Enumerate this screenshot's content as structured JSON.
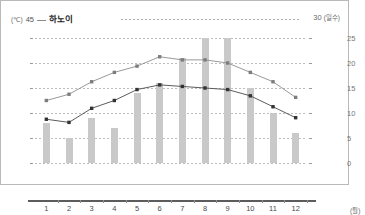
{
  "header": {
    "left_unit": "(℃)",
    "left_axis_max": "45",
    "city": "하노이",
    "right_axis_max": "30",
    "right_unit": "(일수)"
  },
  "axes": {
    "left_ticks": [
      "40",
      "32",
      "24",
      "16",
      "8",
      "0"
    ],
    "right_ticks": [
      "25",
      "20",
      "15",
      "10",
      "5",
      "0"
    ],
    "x_ticks": [
      "1",
      "2",
      "3",
      "4",
      "5",
      "6",
      "7",
      "8",
      "9",
      "10",
      "11",
      "12"
    ],
    "x_unit": "(월)"
  },
  "colors": {
    "bar": "#c9c9c9",
    "line": "#4a4a4a",
    "grid": "#bdbdbd",
    "baseline": "#5c5c5c",
    "frame": "#b9b9b9"
  },
  "chart_data": {
    "type": "bar",
    "title": "하노이",
    "xlabel": "(월)",
    "ylabel": "(℃)",
    "y2label": "(일수)",
    "ylim": [
      0,
      45
    ],
    "y2lim": [
      0,
      30
    ],
    "grid": true,
    "legend": "none",
    "categories": [
      "1",
      "2",
      "3",
      "4",
      "5",
      "6",
      "7",
      "8",
      "9",
      "10",
      "11",
      "12"
    ],
    "series": [
      {
        "name": "강수일수",
        "type": "bar",
        "axis": "right",
        "unit": "일수",
        "values": [
          8,
          5,
          9,
          7,
          14,
          16,
          21,
          25,
          25,
          15,
          10,
          6
        ]
      },
      {
        "name": "최고 기온",
        "type": "line",
        "axis": "left",
        "unit": "℃",
        "values": [
          20,
          22,
          26,
          29,
          31,
          34,
          33,
          33,
          32,
          29,
          26,
          21
        ]
      },
      {
        "name": "최저 기온",
        "type": "line",
        "axis": "left",
        "unit": "℃",
        "values": [
          14,
          13,
          17.5,
          20,
          23.5,
          25,
          24.5,
          24,
          23.5,
          21.5,
          18,
          14.5
        ]
      }
    ]
  }
}
